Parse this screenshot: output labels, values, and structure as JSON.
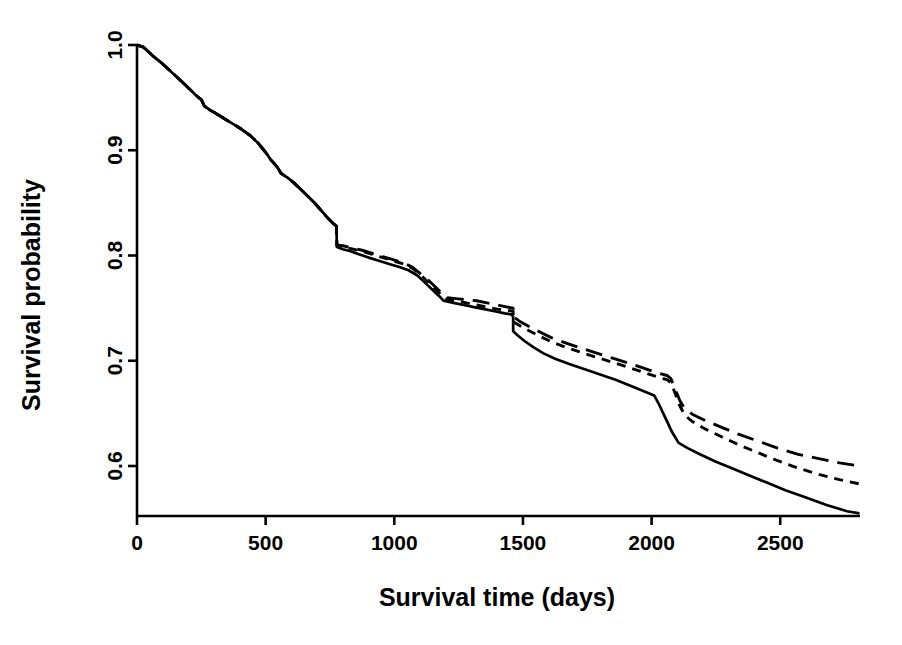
{
  "chart_data": {
    "type": "line",
    "title": "",
    "xlabel": "Survival time (days)",
    "ylabel": "Survival probability",
    "grid": false,
    "legend": null,
    "xlim": [
      0,
      2810
    ],
    "ylim": [
      0.548,
      1.0
    ],
    "xticks": [
      0,
      500,
      1000,
      1500,
      2000,
      2500
    ],
    "xticklabels": [
      "0",
      "500",
      "1000",
      "1500",
      "2000",
      "2500"
    ],
    "yticks": [
      0.6,
      0.7,
      0.8,
      0.9,
      1.0
    ],
    "yticklabels": [
      "0.6",
      "0.7",
      "0.8",
      "0.9",
      "1.0"
    ],
    "series": [
      {
        "name": "solid-curve",
        "style": "solid",
        "color": "#000000",
        "points": [
          [
            0,
            1.0
          ],
          [
            25,
            0.998
          ],
          [
            60,
            0.99
          ],
          [
            100,
            0.982
          ],
          [
            140,
            0.973
          ],
          [
            175,
            0.965
          ],
          [
            205,
            0.958
          ],
          [
            230,
            0.952
          ],
          [
            250,
            0.948
          ],
          [
            262,
            0.942
          ],
          [
            285,
            0.938
          ],
          [
            320,
            0.933
          ],
          [
            360,
            0.927
          ],
          [
            400,
            0.921
          ],
          [
            440,
            0.914
          ],
          [
            470,
            0.907
          ],
          [
            500,
            0.898
          ],
          [
            520,
            0.891
          ],
          [
            545,
            0.884
          ],
          [
            560,
            0.878
          ],
          [
            585,
            0.874
          ],
          [
            610,
            0.869
          ],
          [
            640,
            0.862
          ],
          [
            665,
            0.856
          ],
          [
            690,
            0.85
          ],
          [
            715,
            0.843
          ],
          [
            740,
            0.836
          ],
          [
            760,
            0.831
          ],
          [
            775,
            0.828
          ],
          [
            777,
            0.808
          ],
          [
            800,
            0.806
          ],
          [
            830,
            0.804
          ],
          [
            865,
            0.801
          ],
          [
            900,
            0.798
          ],
          [
            940,
            0.795
          ],
          [
            980,
            0.792
          ],
          [
            1020,
            0.789
          ],
          [
            1055,
            0.786
          ],
          [
            1090,
            0.781
          ],
          [
            1120,
            0.774
          ],
          [
            1150,
            0.767
          ],
          [
            1180,
            0.76
          ],
          [
            1192,
            0.757
          ],
          [
            1230,
            0.755
          ],
          [
            1270,
            0.753
          ],
          [
            1310,
            0.751
          ],
          [
            1350,
            0.749
          ],
          [
            1390,
            0.747
          ],
          [
            1430,
            0.745
          ],
          [
            1455,
            0.744
          ],
          [
            1462,
            0.742
          ],
          [
            1462,
            0.728
          ],
          [
            1480,
            0.724
          ],
          [
            1505,
            0.719
          ],
          [
            1540,
            0.713
          ],
          [
            1580,
            0.707
          ],
          [
            1625,
            0.702
          ],
          [
            1680,
            0.697
          ],
          [
            1740,
            0.692
          ],
          [
            1800,
            0.687
          ],
          [
            1860,
            0.682
          ],
          [
            1920,
            0.676
          ],
          [
            1970,
            0.671
          ],
          [
            2010,
            0.667
          ],
          [
            2030,
            0.658
          ],
          [
            2055,
            0.645
          ],
          [
            2080,
            0.632
          ],
          [
            2105,
            0.622
          ],
          [
            2140,
            0.617
          ],
          [
            2190,
            0.611
          ],
          [
            2250,
            0.604
          ],
          [
            2310,
            0.598
          ],
          [
            2380,
            0.591
          ],
          [
            2450,
            0.584
          ],
          [
            2520,
            0.577
          ],
          [
            2600,
            0.57
          ],
          [
            2680,
            0.563
          ],
          [
            2760,
            0.557
          ],
          [
            2808,
            0.555
          ]
        ]
      },
      {
        "name": "long-dashed-curve",
        "style": "longdash",
        "color": "#000000",
        "points": [
          [
            0,
            1.0
          ],
          [
            25,
            0.998
          ],
          [
            60,
            0.99
          ],
          [
            100,
            0.982
          ],
          [
            140,
            0.973
          ],
          [
            175,
            0.965
          ],
          [
            205,
            0.958
          ],
          [
            230,
            0.952
          ],
          [
            250,
            0.948
          ],
          [
            262,
            0.942
          ],
          [
            285,
            0.938
          ],
          [
            320,
            0.933
          ],
          [
            360,
            0.927
          ],
          [
            400,
            0.921
          ],
          [
            440,
            0.914
          ],
          [
            470,
            0.907
          ],
          [
            500,
            0.898
          ],
          [
            520,
            0.891
          ],
          [
            545,
            0.884
          ],
          [
            560,
            0.878
          ],
          [
            585,
            0.874
          ],
          [
            610,
            0.869
          ],
          [
            640,
            0.862
          ],
          [
            665,
            0.856
          ],
          [
            690,
            0.85
          ],
          [
            715,
            0.843
          ],
          [
            740,
            0.836
          ],
          [
            760,
            0.831
          ],
          [
            775,
            0.828
          ],
          [
            777,
            0.81
          ],
          [
            805,
            0.809
          ],
          [
            840,
            0.807
          ],
          [
            875,
            0.805
          ],
          [
            915,
            0.802
          ],
          [
            955,
            0.799
          ],
          [
            995,
            0.796
          ],
          [
            1035,
            0.793
          ],
          [
            1070,
            0.789
          ],
          [
            1100,
            0.783
          ],
          [
            1130,
            0.777
          ],
          [
            1160,
            0.77
          ],
          [
            1190,
            0.763
          ],
          [
            1205,
            0.76
          ],
          [
            1240,
            0.759
          ],
          [
            1280,
            0.758
          ],
          [
            1320,
            0.757
          ],
          [
            1360,
            0.755
          ],
          [
            1400,
            0.753
          ],
          [
            1440,
            0.751
          ],
          [
            1462,
            0.75
          ],
          [
            1462,
            0.742
          ],
          [
            1490,
            0.737
          ],
          [
            1520,
            0.733
          ],
          [
            1560,
            0.728
          ],
          [
            1610,
            0.722
          ],
          [
            1665,
            0.717
          ],
          [
            1725,
            0.712
          ],
          [
            1790,
            0.707
          ],
          [
            1855,
            0.702
          ],
          [
            1920,
            0.697
          ],
          [
            1980,
            0.692
          ],
          [
            2030,
            0.688
          ],
          [
            2060,
            0.686
          ],
          [
            2075,
            0.683
          ],
          [
            2090,
            0.674
          ],
          [
            2110,
            0.662
          ],
          [
            2130,
            0.654
          ],
          [
            2160,
            0.649
          ],
          [
            2210,
            0.643
          ],
          [
            2270,
            0.637
          ],
          [
            2340,
            0.63
          ],
          [
            2410,
            0.624
          ],
          [
            2490,
            0.617
          ],
          [
            2570,
            0.611
          ],
          [
            2650,
            0.607
          ],
          [
            2730,
            0.603
          ],
          [
            2808,
            0.6
          ]
        ]
      },
      {
        "name": "short-dashed-curve",
        "style": "shortdash",
        "color": "#000000",
        "points": [
          [
            0,
            1.0
          ],
          [
            25,
            0.998
          ],
          [
            60,
            0.99
          ],
          [
            100,
            0.982
          ],
          [
            140,
            0.973
          ],
          [
            175,
            0.965
          ],
          [
            205,
            0.958
          ],
          [
            230,
            0.952
          ],
          [
            250,
            0.948
          ],
          [
            262,
            0.942
          ],
          [
            285,
            0.938
          ],
          [
            320,
            0.933
          ],
          [
            360,
            0.927
          ],
          [
            400,
            0.921
          ],
          [
            440,
            0.914
          ],
          [
            470,
            0.907
          ],
          [
            500,
            0.898
          ],
          [
            520,
            0.891
          ],
          [
            545,
            0.884
          ],
          [
            560,
            0.878
          ],
          [
            585,
            0.874
          ],
          [
            610,
            0.869
          ],
          [
            640,
            0.862
          ],
          [
            665,
            0.856
          ],
          [
            690,
            0.85
          ],
          [
            715,
            0.843
          ],
          [
            740,
            0.836
          ],
          [
            760,
            0.831
          ],
          [
            775,
            0.828
          ],
          [
            777,
            0.809
          ],
          [
            805,
            0.808
          ],
          [
            840,
            0.806
          ],
          [
            875,
            0.804
          ],
          [
            915,
            0.801
          ],
          [
            955,
            0.798
          ],
          [
            995,
            0.795
          ],
          [
            1035,
            0.792
          ],
          [
            1070,
            0.788
          ],
          [
            1100,
            0.782
          ],
          [
            1130,
            0.775
          ],
          [
            1160,
            0.768
          ],
          [
            1190,
            0.761
          ],
          [
            1205,
            0.758
          ],
          [
            1240,
            0.757
          ],
          [
            1280,
            0.755
          ],
          [
            1320,
            0.753
          ],
          [
            1360,
            0.751
          ],
          [
            1400,
            0.749
          ],
          [
            1440,
            0.748
          ],
          [
            1462,
            0.747
          ],
          [
            1462,
            0.737
          ],
          [
            1490,
            0.733
          ],
          [
            1520,
            0.729
          ],
          [
            1560,
            0.724
          ],
          [
            1610,
            0.718
          ],
          [
            1665,
            0.713
          ],
          [
            1725,
            0.708
          ],
          [
            1790,
            0.703
          ],
          [
            1855,
            0.698
          ],
          [
            1920,
            0.693
          ],
          [
            1980,
            0.688
          ],
          [
            2030,
            0.684
          ],
          [
            2060,
            0.682
          ],
          [
            2075,
            0.679
          ],
          [
            2090,
            0.67
          ],
          [
            2110,
            0.657
          ],
          [
            2130,
            0.648
          ],
          [
            2160,
            0.642
          ],
          [
            2210,
            0.635
          ],
          [
            2270,
            0.628
          ],
          [
            2340,
            0.62
          ],
          [
            2410,
            0.613
          ],
          [
            2490,
            0.605
          ],
          [
            2570,
            0.598
          ],
          [
            2650,
            0.592
          ],
          [
            2730,
            0.587
          ],
          [
            2808,
            0.583
          ]
        ]
      }
    ]
  }
}
